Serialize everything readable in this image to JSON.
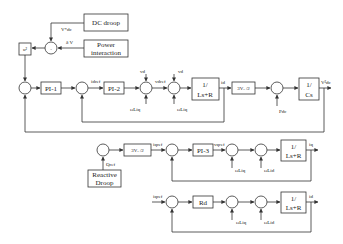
{
  "diagram": {
    "type": "control block diagram",
    "blocks": {
      "dc_droop": "DC droop",
      "power_interaction_1": "Power",
      "power_interaction_2": "interaction",
      "square": "u²",
      "pi1": "PI-1",
      "pi2": "PI-2",
      "plant_d_num": "1/",
      "plant_d_den": "Ls+R",
      "gain_p": "3Vₓ /2",
      "cap_num": "1/",
      "cap_den": "Cs",
      "gain_q": "3Vₓ /2",
      "pi3": "PI-3",
      "plant_q_num": "1/",
      "plant_q_den": "Ls+R",
      "reactive_droop_1": "Reactive",
      "reactive_droop_2": "Droop",
      "rd": "Rd",
      "plant_3_num": "1/",
      "plant_3_den": "Ls+R"
    },
    "signals": {
      "vdc_ref": "V*dc",
      "delta_v": "δ V",
      "id_ref": "idref",
      "vd_top1": "vd",
      "vd_top2": "vd",
      "vdref": "vdref",
      "coupling1": "ωLiq",
      "coupling2": "ωLiq",
      "id_out": "id",
      "pdc": "Pdc",
      "vdc2_out": "V²dc",
      "qref": "Qref",
      "iq_ref": "iqref",
      "vq_ref": "vqref",
      "coupling3": "ωLiq",
      "coupling4": "ωLid",
      "iq_out": "iq",
      "i_ref3": "iqref",
      "coupling5": "ωLiq",
      "coupling6": "ωLid",
      "i_out3": "id"
    },
    "sum_signs": {
      "top": [
        "+",
        "-"
      ],
      "row1_first": [
        "+",
        "-"
      ]
    }
  }
}
